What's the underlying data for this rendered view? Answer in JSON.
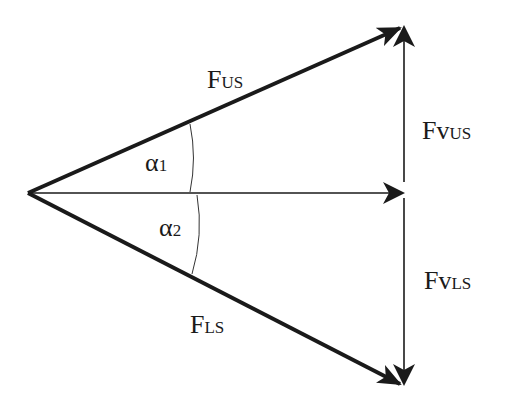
{
  "diagram": {
    "type": "force-vector-decomposition",
    "vectors": [
      {
        "name": "F_US",
        "label_main": "F",
        "label_sub": "US",
        "from": [
          28,
          193
        ],
        "to": [
          402,
          27
        ],
        "weight": "bold"
      },
      {
        "name": "F_LS",
        "label_main": "F",
        "label_sub": "LS",
        "from": [
          28,
          193
        ],
        "to": [
          402,
          385
        ],
        "weight": "bold"
      },
      {
        "name": "resultant",
        "from": [
          28,
          193
        ],
        "to": [
          404,
          193
        ],
        "weight": "thin"
      },
      {
        "name": "Fv_US",
        "label_main": "Fv",
        "label_sub": "US",
        "from": [
          404,
          182
        ],
        "to": [
          404,
          25
        ],
        "weight": "thin"
      },
      {
        "name": "Fv_LS",
        "label_main": "Fv",
        "label_sub": "LS",
        "from": [
          404,
          198
        ],
        "to": [
          404,
          385
        ],
        "weight": "thin"
      }
    ],
    "angles": [
      {
        "name": "alpha_1",
        "label_main": "α",
        "label_sub": "1"
      },
      {
        "name": "alpha_2",
        "label_main": "α",
        "label_sub": "2"
      }
    ],
    "stroke_color": "#1a1a1a",
    "background": "#ffffff"
  }
}
